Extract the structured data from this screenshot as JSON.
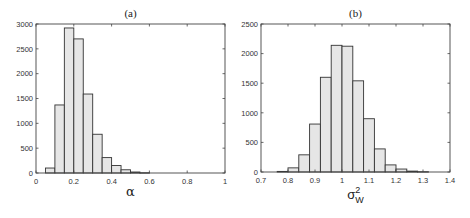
{
  "chart_data": [
    {
      "type": "bar",
      "title": "(a)",
      "xlabel": "α",
      "ylabel": "",
      "xlim": [
        0,
        1
      ],
      "ylim": [
        0,
        3000
      ],
      "xticks": [
        "0",
        "0.2",
        "0.4",
        "0.6",
        "0.8",
        "1"
      ],
      "xtick_values": [
        0,
        0.2,
        0.4,
        0.6,
        0.8,
        1
      ],
      "yticks": [
        "0",
        "500",
        "1000",
        "1500",
        "2000",
        "2500",
        "3000"
      ],
      "ytick_values": [
        0,
        500,
        1000,
        1500,
        2000,
        2500,
        3000
      ],
      "grid": false,
      "bin_width": 0.05,
      "categories": [
        "0.05-0.10",
        "0.10-0.15",
        "0.15-0.20",
        "0.20-0.25",
        "0.25-0.30",
        "0.30-0.35",
        "0.35-0.40",
        "0.40-0.45",
        "0.45-0.50",
        "0.50-0.55",
        "0.55-0.60"
      ],
      "bin_starts": [
        0.05,
        0.1,
        0.15,
        0.2,
        0.25,
        0.3,
        0.35,
        0.4,
        0.45,
        0.5,
        0.55
      ],
      "values": [
        100,
        1370,
        2920,
        2700,
        1590,
        780,
        310,
        150,
        65,
        20,
        5
      ]
    },
    {
      "type": "bar",
      "title": "(b)",
      "xlabel": "σ",
      "xlabel_sup": "2",
      "xlabel_sub": "W",
      "ylabel": "",
      "xlim": [
        0.7,
        1.4
      ],
      "ylim": [
        0,
        2500
      ],
      "xticks": [
        "0.7",
        "0.8",
        "0.9",
        "1",
        "1.1",
        "1.2",
        "1.3",
        "1.4"
      ],
      "xtick_values": [
        0.7,
        0.8,
        0.9,
        1.0,
        1.1,
        1.2,
        1.3,
        1.4
      ],
      "yticks": [
        "0",
        "500",
        "1000",
        "1500",
        "2000",
        "2500"
      ],
      "ytick_values": [
        0,
        500,
        1000,
        1500,
        2000,
        2500
      ],
      "grid": false,
      "bin_width": 0.04,
      "categories": [
        "0.76-0.80",
        "0.80-0.84",
        "0.84-0.88",
        "0.88-0.92",
        "0.92-0.96",
        "0.96-1.00",
        "1.00-1.04",
        "1.04-1.08",
        "1.08-1.12",
        "1.12-1.16",
        "1.16-1.20",
        "1.20-1.24",
        "1.24-1.28",
        "1.28-1.32"
      ],
      "bin_starts": [
        0.76,
        0.8,
        0.84,
        0.88,
        0.92,
        0.96,
        1.0,
        1.04,
        1.08,
        1.12,
        1.16,
        1.2,
        1.24,
        1.28
      ],
      "values": [
        10,
        70,
        290,
        810,
        1600,
        2140,
        2125,
        1540,
        900,
        390,
        120,
        50,
        15,
        5
      ]
    }
  ],
  "layout": {
    "panels": [
      {
        "left": 36,
        "right": 225,
        "top": 24,
        "bottom": 173
      },
      {
        "left": 261,
        "right": 450,
        "top": 24,
        "bottom": 172
      }
    ],
    "colors": {
      "bar_fill": "#e6e6e6",
      "bar_stroke": "#333333",
      "axis": "#444444"
    }
  }
}
